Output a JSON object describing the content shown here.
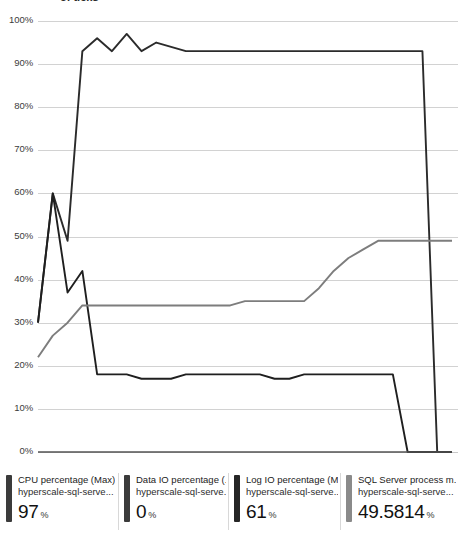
{
  "chart": {
    "clipped_title": "of ticks",
    "y_axis": {
      "ticks": [
        "100%",
        "90%",
        "80%",
        "70%",
        "60%",
        "50%",
        "40%",
        "30%",
        "20%",
        "10%",
        "0%"
      ]
    }
  },
  "legend": {
    "items": [
      {
        "metric": "CPU percentage (Max)",
        "resource": "hyperscale-sql-serve...",
        "value": "97",
        "unit": "%",
        "color": "#3b3b3b"
      },
      {
        "metric": "Data IO percentage (...",
        "resource": "hyperscale-sql-serve...",
        "value": "0",
        "unit": "%",
        "color": "#3b3b3b"
      },
      {
        "metric": "Log IO percentage (Max)",
        "resource": "hyperscale-sql-serve...",
        "value": "61",
        "unit": "%",
        "color": "#262626"
      },
      {
        "metric": "SQL Server process m...",
        "resource": "hyperscale-sql-serve...",
        "value": "49.5814",
        "unit": "%",
        "color": "#8a8a8a"
      }
    ]
  },
  "chart_data": {
    "type": "line",
    "title": "",
    "xlabel": "",
    "ylabel": "",
    "ylim": [
      0,
      100
    ],
    "grid": true,
    "legend_position": "bottom",
    "axis_pixels": {
      "y100": 21,
      "y0": 452,
      "x_left": 38,
      "x_right": 452
    },
    "x": [
      0,
      1,
      2,
      3,
      4,
      5,
      6,
      7,
      8,
      9,
      10,
      11,
      12,
      13,
      14,
      15,
      16,
      17,
      18,
      19,
      20,
      21,
      22,
      23,
      24,
      25,
      26,
      27,
      28
    ],
    "series": [
      {
        "name": "CPU percentage (Max)",
        "color": "#2b2b2b",
        "width": 1.9,
        "values": [
          30,
          60,
          49,
          93,
          96,
          93,
          97,
          93,
          95,
          94,
          93,
          93,
          93,
          93,
          93,
          93,
          93,
          93,
          93,
          93,
          93,
          93,
          93,
          93,
          93,
          93,
          93,
          0,
          0
        ]
      },
      {
        "name": "Log IO percentage (Max)",
        "color": "#1f1f1f",
        "width": 1.9,
        "values": [
          30,
          60,
          37,
          42,
          18,
          18,
          18,
          17,
          17,
          17,
          18,
          18,
          18,
          18,
          18,
          18,
          17,
          17,
          18,
          18,
          18,
          18,
          18,
          18,
          18,
          0,
          0,
          0,
          0
        ]
      },
      {
        "name": "SQL Server process memory percent",
        "color": "#7d7d7d",
        "width": 1.9,
        "values": [
          22,
          27,
          30,
          34,
          34,
          34,
          34,
          34,
          34,
          34,
          34,
          34,
          34,
          34,
          35,
          35,
          35,
          35,
          35,
          38,
          42,
          45,
          47,
          49,
          49,
          49,
          49,
          49,
          49
        ]
      },
      {
        "name": "Data IO percentage (Max)",
        "color": "#555555",
        "width": 1.4,
        "values": [
          0,
          0,
          0,
          0,
          0,
          0,
          0,
          0,
          0,
          0,
          0,
          0,
          0,
          0,
          0,
          0,
          0,
          0,
          0,
          0,
          0,
          0,
          0,
          0,
          0,
          0,
          0,
          0,
          0
        ]
      }
    ]
  }
}
